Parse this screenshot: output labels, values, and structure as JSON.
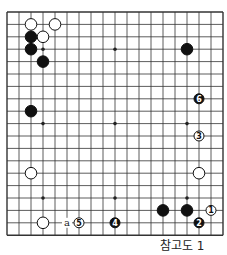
{
  "board": {
    "size": 19,
    "origin_x": 7,
    "origin_y": 12,
    "step_x": 12,
    "step_y": 12.4
  },
  "star_points": [
    [
      3,
      3
    ],
    [
      9,
      3
    ],
    [
      15,
      3
    ],
    [
      3,
      9
    ],
    [
      9,
      9
    ],
    [
      15,
      9
    ],
    [
      3,
      15
    ],
    [
      9,
      15
    ],
    [
      15,
      15
    ]
  ],
  "stones": [
    {
      "c": 2,
      "r": 1,
      "color": "white",
      "label": ""
    },
    {
      "c": 4,
      "r": 1,
      "color": "white",
      "label": ""
    },
    {
      "c": 3,
      "r": 2,
      "color": "white",
      "label": ""
    },
    {
      "c": 2,
      "r": 2,
      "color": "black",
      "label": ""
    },
    {
      "c": 2,
      "r": 3,
      "color": "black",
      "label": ""
    },
    {
      "c": 3,
      "r": 4,
      "color": "black",
      "label": ""
    },
    {
      "c": 15,
      "r": 3,
      "color": "black",
      "label": ""
    },
    {
      "c": 16,
      "r": 7,
      "color": "black",
      "label": "6"
    },
    {
      "c": 2,
      "r": 8,
      "color": "black",
      "label": ""
    },
    {
      "c": 16,
      "r": 10,
      "color": "white",
      "label": "3"
    },
    {
      "c": 2,
      "r": 13,
      "color": "white",
      "label": ""
    },
    {
      "c": 16,
      "r": 13,
      "color": "white",
      "label": ""
    },
    {
      "c": 13,
      "r": 16,
      "color": "black",
      "label": ""
    },
    {
      "c": 15,
      "r": 16,
      "color": "black",
      "label": ""
    },
    {
      "c": 17,
      "r": 16,
      "color": "white",
      "label": "1"
    },
    {
      "c": 16,
      "r": 17,
      "color": "black",
      "label": "2"
    },
    {
      "c": 3,
      "r": 17,
      "color": "white",
      "label": ""
    },
    {
      "c": 6,
      "r": 17,
      "color": "white",
      "label": "5"
    },
    {
      "c": 9,
      "r": 17,
      "color": "black",
      "label": "4"
    }
  ],
  "marks": [
    {
      "c": 5,
      "r": 17,
      "text": "a"
    }
  ],
  "caption": "참고도 1"
}
